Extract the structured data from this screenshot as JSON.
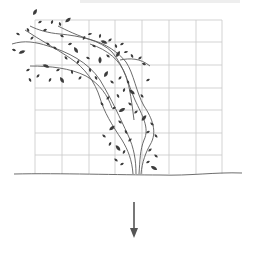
{
  "diagram": {
    "colors": {
      "background": "#ffffff",
      "grid": "#c8c8c8",
      "ground": "#6e6e6e",
      "stem": "#5a5a5a",
      "leaf": "#3c3c3c",
      "arrow": "#555555",
      "top_strip": "#eeeeee"
    },
    "grid": {
      "x_lines": [
        35,
        62,
        89,
        115,
        142,
        169,
        196,
        222
      ],
      "y_lines": [
        20,
        42,
        65,
        88,
        110,
        133,
        155
      ],
      "top": 20,
      "bottom": 174,
      "left": 35,
      "right": 222
    },
    "ground": {
      "path": "M14 174 C 60 173, 120 175, 160 175 C 190 176, 215 172, 242 173"
    },
    "stems": [
      "M133 174 C 132 160, 128 150, 122 140 C 112 125, 104 112, 100 98 C 95 82, 85 68, 70 58 C 55 48, 40 40, 25 30",
      "M136 174 C 136 160, 134 148, 128 135 C 120 118, 112 100, 100 80 C 88 62, 68 52, 48 46 C 36 42, 24 40, 12 44",
      "M139 174 C 140 160, 140 150, 144 140 C 150 128, 142 115, 135 100 C 128 84, 124 66, 112 52 C 100 40, 80 36, 60 34 C 48 33, 38 30, 30 26",
      "M141 174 C 142 162, 146 152, 150 145 C 158 132, 152 118, 144 106 C 136 92, 134 74, 126 62 C 118 52, 106 44, 92 40 C 78 36, 66 30, 58 26",
      "M134 120 C 132 104, 130 88, 126 76 C 120 60, 108 50, 90 44",
      "M120 60 C 130 58, 140 58, 150 66",
      "M30 66 C 50 66, 70 68, 86 76 C 100 84, 108 96, 112 108"
    ],
    "leaves": [
      [
        35,
        12,
        -60
      ],
      [
        40,
        22,
        -30
      ],
      [
        28,
        30,
        -120
      ],
      [
        18,
        34,
        -150
      ],
      [
        14,
        50,
        -160
      ],
      [
        22,
        52,
        160
      ],
      [
        32,
        38,
        -45
      ],
      [
        45,
        30,
        -20
      ],
      [
        52,
        22,
        -70
      ],
      [
        60,
        24,
        -110
      ],
      [
        68,
        20,
        -40
      ],
      [
        62,
        36,
        30
      ],
      [
        48,
        44,
        -140
      ],
      [
        55,
        48,
        40
      ],
      [
        70,
        44,
        -20
      ],
      [
        76,
        50,
        60
      ],
      [
        84,
        38,
        -60
      ],
      [
        90,
        34,
        -10
      ],
      [
        94,
        46,
        30
      ],
      [
        100,
        36,
        -80
      ],
      [
        104,
        42,
        20
      ],
      [
        110,
        40,
        -40
      ],
      [
        116,
        46,
        70
      ],
      [
        122,
        44,
        -30
      ],
      [
        108,
        56,
        40
      ],
      [
        118,
        54,
        -60
      ],
      [
        126,
        52,
        -10
      ],
      [
        132,
        56,
        60
      ],
      [
        140,
        58,
        -40
      ],
      [
        144,
        64,
        20
      ],
      [
        100,
        60,
        -90
      ],
      [
        88,
        58,
        -150
      ],
      [
        78,
        62,
        120
      ],
      [
        66,
        58,
        -130
      ],
      [
        58,
        70,
        150
      ],
      [
        46,
        66,
        -160
      ],
      [
        38,
        76,
        130
      ],
      [
        30,
        80,
        -120
      ],
      [
        28,
        70,
        150
      ],
      [
        50,
        80,
        120
      ],
      [
        62,
        80,
        -120
      ],
      [
        72,
        72,
        80
      ],
      [
        80,
        78,
        130
      ],
      [
        90,
        70,
        -100
      ],
      [
        96,
        78,
        60
      ],
      [
        106,
        74,
        -60
      ],
      [
        112,
        82,
        40
      ],
      [
        120,
        78,
        -50
      ],
      [
        128,
        82,
        60
      ],
      [
        124,
        90,
        -70
      ],
      [
        132,
        92,
        40
      ],
      [
        118,
        96,
        -120
      ],
      [
        108,
        98,
        130
      ],
      [
        102,
        104,
        -130
      ],
      [
        114,
        108,
        150
      ],
      [
        122,
        110,
        -30
      ],
      [
        130,
        104,
        40
      ],
      [
        136,
        112,
        -40
      ],
      [
        142,
        96,
        50
      ],
      [
        148,
        80,
        -30
      ],
      [
        144,
        118,
        -50
      ],
      [
        152,
        124,
        40
      ],
      [
        148,
        132,
        -30
      ],
      [
        156,
        136,
        50
      ],
      [
        120,
        122,
        -140
      ],
      [
        112,
        128,
        140
      ],
      [
        104,
        136,
        -140
      ],
      [
        110,
        144,
        120
      ],
      [
        126,
        132,
        -120
      ],
      [
        130,
        140,
        140
      ],
      [
        118,
        148,
        -130
      ],
      [
        124,
        152,
        120
      ],
      [
        150,
        150,
        -40
      ],
      [
        156,
        156,
        40
      ],
      [
        148,
        162,
        -30
      ],
      [
        154,
        168,
        30
      ],
      [
        116,
        160,
        -140
      ],
      [
        122,
        164,
        150
      ]
    ],
    "arrow": {
      "x": 134,
      "y_start": 202,
      "y_end": 238,
      "direction": "down"
    }
  }
}
